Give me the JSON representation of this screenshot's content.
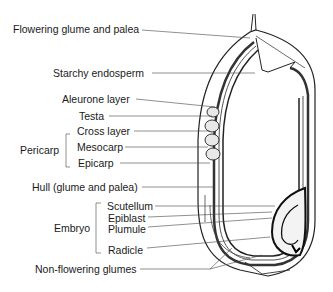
{
  "labels": {
    "flowering_glume": "Flowering glume and palea",
    "starchy_endosperm": "Starchy endosperm",
    "aleurone": "Aleurone layer",
    "testa": "Testa",
    "pericarp": "Pericarp",
    "cross_layer": "Cross layer",
    "mesocarp": "Mesocarp",
    "epicarp": "Epicarp",
    "hull": "Hull (glume and palea)",
    "embryo": "Embryo",
    "scutellum": "Scutellum",
    "epiblast": "Epiblast",
    "plumule": "Plumule",
    "radicle": "Radicle",
    "non_flowering": "Non-flowering glumes"
  }
}
